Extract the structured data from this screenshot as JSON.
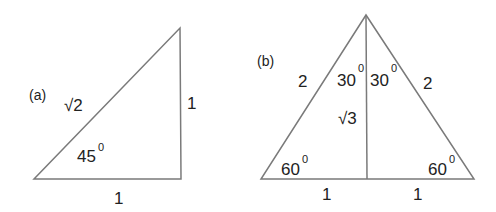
{
  "diagram": {
    "triangle_a": {
      "label": "(a)",
      "hypotenuse": "√2",
      "vertical_side": "1",
      "base": "1",
      "angle": "45",
      "degree": "0"
    },
    "triangle_b": {
      "label": "(b)",
      "left_side": "2",
      "right_side": "2",
      "height": "√3",
      "top_left_angle": "30",
      "top_right_angle": "30",
      "bottom_left_angle": "60",
      "bottom_right_angle": "60",
      "degree": "0",
      "base_left": "1",
      "base_right": "1"
    },
    "colors": {
      "line": "#7a7a7a",
      "text": "#222222"
    }
  }
}
